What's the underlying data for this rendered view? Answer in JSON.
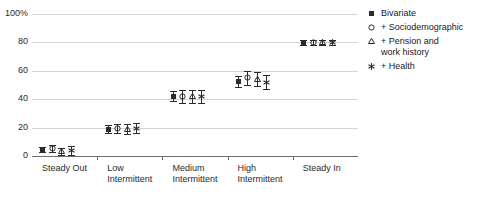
{
  "chart_data": {
    "type": "scatter",
    "title": "",
    "subtitle": "",
    "xlabel": "",
    "ylabel": "",
    "ylim": [
      0,
      100
    ],
    "yticks": [
      "0",
      "20",
      "40",
      "60",
      "80",
      "100%"
    ],
    "ytick_values": [
      0,
      20,
      40,
      60,
      80,
      100
    ],
    "grid": true,
    "legend_position": "right",
    "categories": [
      "Steady Out",
      "Low\nIntermittent",
      "Medium\nIntermittent",
      "High\nIntermittent",
      "Steady In"
    ],
    "error_bars": "95% confidence interval",
    "series": [
      {
        "name": "Bivariate",
        "marker": "filled-square",
        "values": [
          4.5,
          19.0,
          42.0,
          52.5,
          80.0
        ],
        "err_low": [
          2.0,
          2.5,
          3.5,
          4.0,
          1.5
        ],
        "err_high": [
          2.0,
          2.5,
          3.5,
          4.0,
          1.5
        ]
      },
      {
        "name": "+ Sociodemographic",
        "marker": "open-circle",
        "values": [
          5.5,
          19.5,
          42.0,
          55.0,
          80.0
        ],
        "err_low": [
          2.5,
          3.0,
          4.5,
          5.0,
          2.0
        ],
        "err_high": [
          2.5,
          3.0,
          4.5,
          5.0,
          2.0
        ]
      },
      {
        "name": "+ Pension and\nwork history",
        "marker": "open-triangle",
        "values": [
          3.0,
          19.0,
          42.0,
          54.0,
          80.0
        ],
        "err_low": [
          2.5,
          3.5,
          4.5,
          5.0,
          2.0
        ],
        "err_high": [
          2.5,
          3.5,
          4.5,
          5.0,
          2.0
        ]
      },
      {
        "name": "+ Health",
        "marker": "asterisk",
        "values": [
          4.0,
          19.5,
          42.0,
          52.0,
          80.0
        ],
        "err_low": [
          3.0,
          3.5,
          4.5,
          5.0,
          2.0
        ],
        "err_high": [
          3.0,
          3.5,
          4.5,
          5.0,
          2.0
        ]
      }
    ]
  },
  "legend": {
    "items": [
      {
        "label": "Bivariate",
        "marker": "filled-square"
      },
      {
        "label": "+ Sociodemographic",
        "marker": "open-circle"
      },
      {
        "label": "+ Pension and\nwork history",
        "marker": "open-triangle"
      },
      {
        "label": "+ Health",
        "marker": "asterisk"
      }
    ]
  },
  "colors": {
    "marker": "#2b2b2b",
    "gridline": "#d4d4d4",
    "axis": "#6e6e6e",
    "text": "#1a1a1a",
    "background": "#ffffff"
  }
}
